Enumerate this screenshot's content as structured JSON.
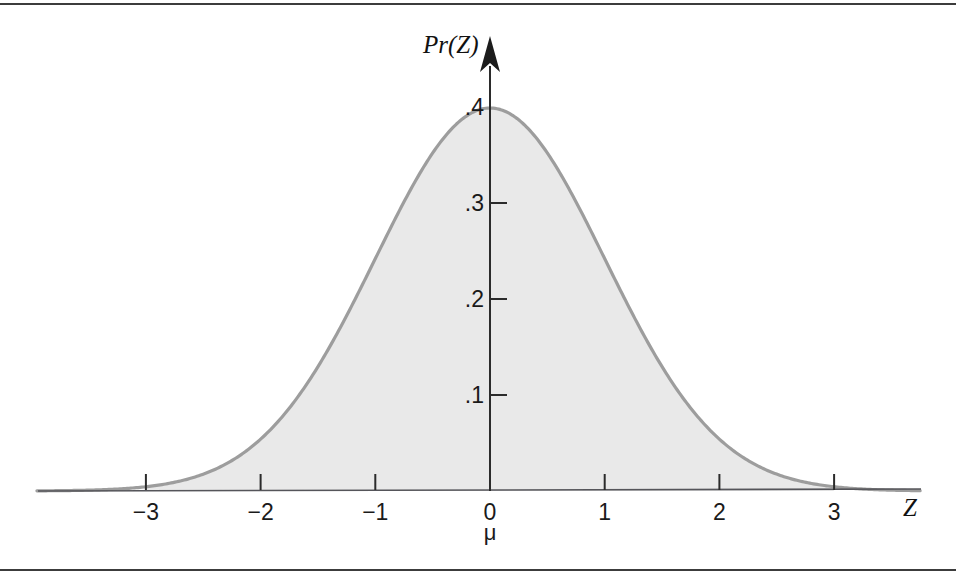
{
  "figure": {
    "caption_rule_top": "",
    "caption_rule_bottom": ""
  },
  "chart_data": {
    "type": "area",
    "title": "",
    "subtitle": "",
    "xlabel": "Z",
    "ylabel": "Pr(Z)",
    "mean_label": "μ",
    "mean_label_x": 0,
    "xlim": [
      -3.95,
      3.75
    ],
    "ylim": [
      0,
      0.42
    ],
    "grid": false,
    "legend": null,
    "x_ticks": [
      -3,
      -2,
      -1,
      0,
      1,
      2,
      3
    ],
    "x_tick_labels": [
      "−3",
      "−2",
      "−1",
      "0",
      "1",
      "2",
      "3"
    ],
    "y_ticks": [
      0.1,
      0.2,
      0.3,
      0.4
    ],
    "y_tick_labels": [
      ".1",
      ".2",
      ".3",
      ".4"
    ],
    "curve_color": "#9d9d9d",
    "fill_color": "#e9e9e9",
    "axis_color": "#55555a",
    "shaded_range": [
      -3,
      3
    ],
    "x": [
      -3.6,
      -3.4,
      -3.2,
      -3.0,
      -2.8,
      -2.6,
      -2.4,
      -2.2,
      -2.0,
      -1.8,
      -1.6,
      -1.4,
      -1.2,
      -1.0,
      -0.8,
      -0.6,
      -0.4,
      -0.2,
      0.0,
      0.2,
      0.4,
      0.6,
      0.8,
      1.0,
      1.2,
      1.4,
      1.6,
      1.8,
      2.0,
      2.2,
      2.4,
      2.6,
      2.8,
      3.0,
      3.2,
      3.4,
      3.6
    ],
    "y": [
      0.0006,
      0.0012,
      0.0024,
      0.0044,
      0.0079,
      0.0136,
      0.0224,
      0.0355,
      0.054,
      0.079,
      0.1109,
      0.1497,
      0.1942,
      0.242,
      0.2897,
      0.3332,
      0.3683,
      0.391,
      0.3989,
      0.391,
      0.3683,
      0.3332,
      0.2897,
      0.242,
      0.1942,
      0.1497,
      0.1109,
      0.079,
      0.054,
      0.0355,
      0.0224,
      0.0136,
      0.0079,
      0.0044,
      0.0024,
      0.0012,
      0.0006
    ]
  }
}
